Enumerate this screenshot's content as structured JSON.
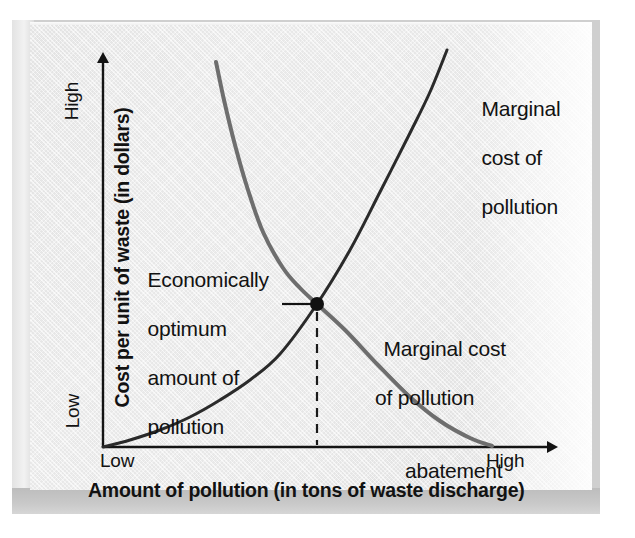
{
  "figure": {
    "title": "Economically optimum amount of pollution",
    "background_color": "#ededed",
    "frame_color": "#cfcfcf"
  },
  "axes": {
    "x": {
      "title": "Amount of pollution (in tons of waste discharge)",
      "tick_low": "Low",
      "tick_high": "High",
      "origin_px": 103,
      "end_px": 560,
      "baseline_px": 447
    },
    "y": {
      "title": "Cost per unit of waste (in dollars)",
      "tick_low": "Low",
      "tick_high": "High",
      "top_px": 50,
      "axis_px": 103
    },
    "axis_color": "#1a1a1a"
  },
  "annotations": {
    "optimum": {
      "line1": "Economically",
      "line2": "optimum",
      "line3": "amount of",
      "line4": "pollution",
      "leader_from_x": 282,
      "leader_to_x": 312,
      "leader_y": 304
    },
    "marginal_cost_pollution": {
      "line1": "Marginal",
      "line2": "cost of",
      "line3": "pollution"
    },
    "marginal_cost_abatement": {
      "line1": "Marginal cost",
      "line2": "of pollution",
      "line3": "abatement"
    }
  },
  "chart_data": {
    "type": "line",
    "title": "Economically optimum amount of pollution",
    "xlabel": "Amount of pollution (in tons of waste discharge)",
    "ylabel": "Cost per unit of waste (in dollars)",
    "xlim": [
      0,
      1
    ],
    "ylim": [
      0,
      1
    ],
    "xticks": [
      "Low",
      "High"
    ],
    "yticks": [
      "Low",
      "High"
    ],
    "grid": false,
    "legend": "inline-annotations",
    "series": [
      {
        "name": "Marginal cost of pollution",
        "color": "#2a2a2a",
        "style": "solid",
        "width": 3,
        "description": "Upward-sloping convex curve rising from the origin",
        "points_px": [
          [
            103,
            447
          ],
          [
            130,
            440
          ],
          [
            160,
            430
          ],
          [
            190,
            417
          ],
          [
            220,
            400
          ],
          [
            250,
            380
          ],
          [
            280,
            354
          ],
          [
            317,
            304
          ],
          [
            350,
            250
          ],
          [
            380,
            192
          ],
          [
            410,
            133
          ],
          [
            430,
            92
          ],
          [
            447,
            50
          ]
        ],
        "points_norm": [
          [
            0.0,
            0.0
          ],
          [
            0.06,
            0.02
          ],
          [
            0.12,
            0.04
          ],
          [
            0.19,
            0.08
          ],
          [
            0.26,
            0.12
          ],
          [
            0.32,
            0.17
          ],
          [
            0.39,
            0.23
          ],
          [
            0.47,
            0.36
          ],
          [
            0.54,
            0.5
          ],
          [
            0.61,
            0.64
          ],
          [
            0.67,
            0.79
          ],
          [
            0.72,
            0.89
          ],
          [
            0.75,
            1.0
          ]
        ]
      },
      {
        "name": "Marginal cost of pollution abatement",
        "color": "#6e6e6e",
        "style": "solid",
        "width": 4,
        "description": "Downward-sloping convex curve falling from upper left to the x-axis",
        "points_px": [
          [
            216,
            62
          ],
          [
            224,
            100
          ],
          [
            235,
            145
          ],
          [
            248,
            190
          ],
          [
            263,
            232
          ],
          [
            283,
            268
          ],
          [
            300,
            288
          ],
          [
            317,
            304
          ],
          [
            345,
            330
          ],
          [
            378,
            365
          ],
          [
            410,
            397
          ],
          [
            440,
            421
          ],
          [
            470,
            438
          ],
          [
            492,
            446
          ]
        ],
        "points_norm": [
          [
            0.25,
            0.97
          ],
          [
            0.26,
            0.87
          ],
          [
            0.29,
            0.76
          ],
          [
            0.32,
            0.65
          ],
          [
            0.35,
            0.54
          ],
          [
            0.39,
            0.45
          ],
          [
            0.43,
            0.4
          ],
          [
            0.47,
            0.36
          ],
          [
            0.53,
            0.29
          ],
          [
            0.6,
            0.21
          ],
          [
            0.67,
            0.13
          ],
          [
            0.74,
            0.06
          ],
          [
            0.8,
            0.02
          ],
          [
            0.85,
            0.0
          ]
        ]
      }
    ],
    "markers": [
      {
        "name": "equilibrium-point",
        "label": "Economically optimum amount of pollution",
        "x_px": 317,
        "y_px": 304,
        "x_norm": 0.47,
        "y_norm": 0.36,
        "color": "#111111",
        "radius": 7
      }
    ],
    "guides": [
      {
        "name": "optimum-dropline",
        "style": "dashed",
        "from_px": [
          317,
          312
        ],
        "to_px": [
          317,
          445
        ],
        "color": "#1a1a1a"
      },
      {
        "name": "optimum-leader",
        "style": "solid",
        "from_px": [
          282,
          304
        ],
        "to_px": [
          312,
          304
        ],
        "color": "#111111"
      }
    ]
  }
}
